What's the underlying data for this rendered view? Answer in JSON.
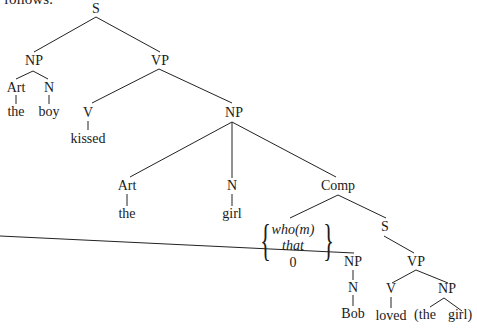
{
  "header_fragment": "follows:",
  "tree": {
    "nodes": {
      "S": "S",
      "NP1": "NP",
      "VP1": "VP",
      "Art1": "Art",
      "N1": "N",
      "the1": "the",
      "boy": "boy",
      "V1": "V",
      "kissed": "kissed",
      "NP2": "NP",
      "Art2": "Art",
      "the2": "the",
      "N2": "N",
      "girl1": "girl",
      "Comp": "Comp",
      "alt_who": "who(m)",
      "alt_that": "that",
      "alt_zero": "0",
      "S2": "S",
      "NP3": "NP",
      "N3": "N",
      "Bob": "Bob",
      "VP2": "VP",
      "V2": "V",
      "loved": "loved",
      "NP4": "NP",
      "the3": "(the",
      "girl2": "girl)"
    }
  }
}
